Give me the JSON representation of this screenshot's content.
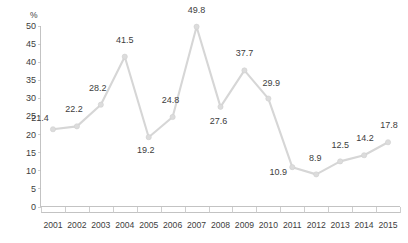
{
  "chart_data": {
    "type": "line",
    "title": "",
    "subtitle": "",
    "xlabel": "",
    "ylabel": "%",
    "unit_label": "%",
    "categories": [
      "2001",
      "2002",
      "2003",
      "2004",
      "2005",
      "2006",
      "2007",
      "2008",
      "2009",
      "2010",
      "2011",
      "2012",
      "2013",
      "2014",
      "2015"
    ],
    "values": [
      21.4,
      22.2,
      28.2,
      41.5,
      19.2,
      24.8,
      49.8,
      27.6,
      37.7,
      29.9,
      10.9,
      8.9,
      12.5,
      14.2,
      17.8
    ],
    "data_labels": [
      "21.4",
      "22.2",
      "28.2",
      "41.5",
      "19.2",
      "24.8",
      "49.8",
      "27.6",
      "37.7",
      "29.9",
      "10.9",
      "8.9",
      "12.5",
      "14.2",
      "17.8"
    ],
    "ylim": [
      0,
      50
    ],
    "ytick_values": [
      0,
      5,
      10,
      15,
      20,
      25,
      30,
      35,
      40,
      45,
      50
    ],
    "ytick_labels": [
      "0",
      "5",
      "10",
      "15",
      "20",
      "25",
      "30",
      "35",
      "40",
      "45",
      "50"
    ],
    "grid": false,
    "legend": null,
    "legend_position": "none",
    "series": [
      {
        "name": "",
        "values": [
          21.4,
          22.2,
          28.2,
          41.5,
          19.2,
          24.8,
          49.8,
          27.6,
          37.7,
          29.9,
          10.9,
          8.9,
          12.5,
          14.2,
          17.8
        ],
        "line_color": "#d6d6d6",
        "marker_color": "#dcdcdc"
      }
    ],
    "label_offsets": [
      {
        "dx": -13,
        "dy": -8
      },
      {
        "dx": -3,
        "dy": -14
      },
      {
        "dx": -3,
        "dy": -14
      },
      {
        "dx": 0,
        "dy": -14
      },
      {
        "dx": -3,
        "dy": 16
      },
      {
        "dx": -2,
        "dy": -14
      },
      {
        "dx": 0,
        "dy": -14
      },
      {
        "dx": -2,
        "dy": 17
      },
      {
        "dx": 0,
        "dy": -14
      },
      {
        "dx": 3,
        "dy": -13
      },
      {
        "dx": -14,
        "dy": 8
      },
      {
        "dx": -1,
        "dy": -13
      },
      {
        "dx": 0,
        "dy": -13
      },
      {
        "dx": 1,
        "dy": -14
      },
      {
        "dx": 1,
        "dy": -14
      }
    ],
    "colors": {
      "line": "#d6d6d6",
      "marker": "#dcdcdc",
      "axis": "#bdbdbd",
      "text": "#3d3d3d",
      "background": "#ffffff"
    }
  }
}
